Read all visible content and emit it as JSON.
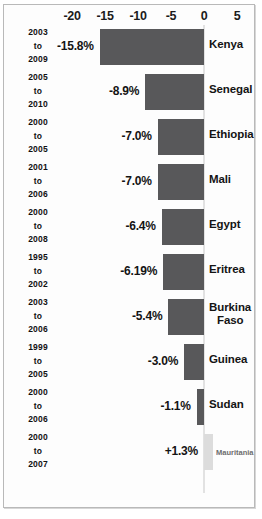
{
  "chart_data": {
    "type": "bar",
    "orientation": "horizontal",
    "title": "",
    "subtitle": "",
    "xlabel": "",
    "ylabel": "",
    "xlim": [
      -22.5,
      7.5
    ],
    "grid": false,
    "legend": null,
    "axis_ticks": [
      {
        "label": "-20",
        "value": -20
      },
      {
        "label": "-15",
        "value": -15
      },
      {
        "label": "-10",
        "value": -10
      },
      {
        "label": "-5",
        "value": -5
      },
      {
        "label": "0",
        "value": 0
      },
      {
        "label": "5",
        "value": 5
      }
    ],
    "zero_line": 0,
    "bar_color": "#58585a",
    "positive_bar_color": "#dcdcdc",
    "categories": [
      "Kenya",
      "Senegal",
      "Ethiopia",
      "Mali",
      "Egypt",
      "Eritrea",
      "Burkina Faso",
      "Guinea",
      "Sudan",
      "Mauritania"
    ],
    "values": [
      -15.8,
      -8.9,
      -7.0,
      -7.0,
      -6.4,
      -6.19,
      -5.4,
      -3.0,
      -1.1,
      1.3
    ],
    "rows": [
      {
        "country": "Kenya",
        "country_lines": [
          "Kenya"
        ],
        "value": -15.8,
        "value_label": "-15.8%",
        "period_start": "2003",
        "period_sep": "to",
        "period_end": "2009"
      },
      {
        "country": "Senegal",
        "country_lines": [
          "Senegal"
        ],
        "value": -8.9,
        "value_label": "-8.9%",
        "period_start": "2005",
        "period_sep": "to",
        "period_end": "2010"
      },
      {
        "country": "Ethiopia",
        "country_lines": [
          "Ethiopia"
        ],
        "value": -7.0,
        "value_label": "-7.0%",
        "period_start": "2000",
        "period_sep": "to",
        "period_end": "2005"
      },
      {
        "country": "Mali",
        "country_lines": [
          "Mali"
        ],
        "value": -7.0,
        "value_label": "-7.0%",
        "period_start": "2001",
        "period_sep": "to",
        "period_end": "2006"
      },
      {
        "country": "Egypt",
        "country_lines": [
          "Egypt"
        ],
        "value": -6.4,
        "value_label": "-6.4%",
        "period_start": "2000",
        "period_sep": "to",
        "period_end": "2008"
      },
      {
        "country": "Eritrea",
        "country_lines": [
          "Eritrea"
        ],
        "value": -6.19,
        "value_label": "-6.19%",
        "period_start": "1995",
        "period_sep": "to",
        "period_end": "2002"
      },
      {
        "country": "Burkina Faso",
        "country_lines": [
          "Burkina",
          "Faso"
        ],
        "value": -5.4,
        "value_label": "-5.4%",
        "period_start": "2003",
        "period_sep": "to",
        "period_end": "2006"
      },
      {
        "country": "Guinea",
        "country_lines": [
          "Guinea"
        ],
        "value": -3.0,
        "value_label": "-3.0%",
        "period_start": "1999",
        "period_sep": "to",
        "period_end": "2005"
      },
      {
        "country": "Sudan",
        "country_lines": [
          "Sudan"
        ],
        "value": -1.1,
        "value_label": "-1.1%",
        "period_start": "2000",
        "period_sep": "to",
        "period_end": "2006"
      },
      {
        "country": "Mauritania",
        "country_lines": [
          "Mauritania"
        ],
        "value": 1.3,
        "value_label": "+1.3%",
        "period_start": "2000",
        "period_sep": "to",
        "period_end": "2007"
      }
    ]
  }
}
